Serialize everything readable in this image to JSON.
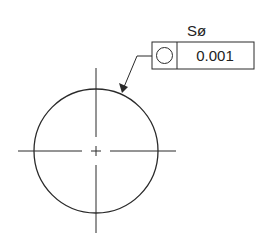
{
  "drawing": {
    "title": "Spherical form tolerance callout",
    "stroke_color": "#2a2a2a",
    "background": "#ffffff"
  },
  "callout": {
    "prefix_label": "Sø",
    "frame": {
      "symbol": "circularity-symbol",
      "symbol_glyph": "○",
      "tolerance_value": "0.001"
    }
  },
  "geometry": {
    "circle": {
      "cx": 96,
      "cy": 151,
      "r": 62
    },
    "centerlines": {
      "horizontal": {
        "x1": 18,
        "x2": 176,
        "y": 151
      },
      "vertical": {
        "x": 96,
        "y1": 68,
        "y2": 233
      }
    },
    "leader": {
      "start": [
        152,
        56
      ],
      "elbow": [
        137,
        56
      ],
      "tip": [
        122,
        92
      ]
    }
  }
}
